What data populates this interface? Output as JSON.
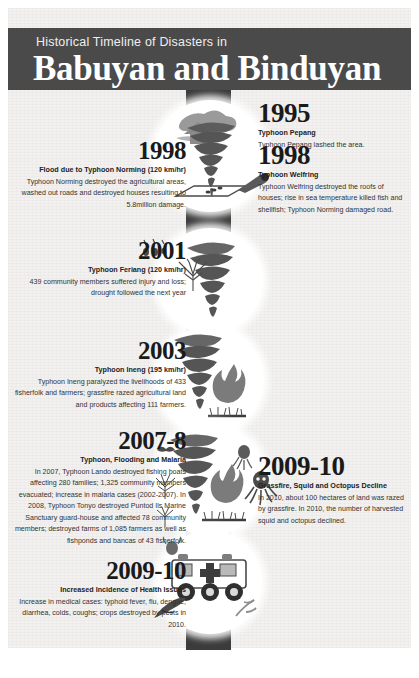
{
  "poster": {
    "background_color": "#f2f1ef",
    "band_color": "#3b3b3b",
    "header_band_color": "#4a4a4a",
    "header": {
      "subtitle": "Historical Timeline of Disasters in",
      "title": "Babuyan and Binduyan"
    }
  },
  "timeline": {
    "entries": [
      {
        "id": "e1995",
        "side": "right",
        "year": "1995",
        "headline": "Typhoon Pepang",
        "body": "Typhoon Pepang lashed the area.",
        "icon": "storm-cloud-icon"
      },
      {
        "id": "e1998-left",
        "side": "left",
        "year": "1998",
        "headline": "Flood due to Typhoon Norming (120 km/hr)",
        "body": "Typhoon Norming destroyed the agricultural areas, washed out roads and destroyed houses resulting to 5.8million damage.",
        "icon": "tornado-icon"
      },
      {
        "id": "e1998-right",
        "side": "right",
        "year": "1998",
        "headline": "Typhoon Welfring",
        "body": "Typhoon Welfring destroyed the roofs of houses; rise in sea temperature killed fish and shellfish; Typhoon Norming damaged road.",
        "icon": "broken-roof-icon"
      },
      {
        "id": "e2001",
        "side": "left",
        "year": "2001",
        "headline": "Typhoon Feriang (120 km/hr)",
        "body": "439 community members suffered injury and loss; drought followed the next year",
        "icon": "drought-tree-icon"
      },
      {
        "id": "e2003",
        "side": "left",
        "year": "2003",
        "headline": "Typhoon Ineng (195 km/hr)",
        "body": "Typhoon Ineng paralyzed the livelihoods of 433 fisherfolk and farmers; grassfire razed agricultural land and products affecting 111 farmers.",
        "icon": "grassfire-icon"
      },
      {
        "id": "e2007-8",
        "side": "left",
        "year": "2007-8",
        "headline": "Typhoon, Flooding and Malaria",
        "body": "In 2007, Typhoon Lando destroyed fishing boats affecting 280 families; 1,325 community members evacuated; increase in malaria cases (2002-2007). In 2008, Typhoon Tonyo destroyed Puntod Ils Marine Sanctuary guard-house and affected 78 community members; destroyed farms of 1,085 farmers as well as fishponds and bancas of 43 fisherfolk.",
        "icon": "tornado-fire-icon"
      },
      {
        "id": "e2009-10-right",
        "side": "right",
        "year": "2009-10",
        "headline": "Grassfire, Squid and Octopus Decline",
        "body": "In 2010, about 100 hectares of land was razed by grassfire. In 2010, the number of harvested squid and octopus declined.",
        "icon": "squid-icon"
      },
      {
        "id": "e2009-10-left",
        "side": "left",
        "year": "2009-10",
        "headline": "Increased Incidence of Health Issues",
        "body": "Increase in medical cases: typhoid fever, flu, dengue, diarrhea, colds, coughs; crops destroyed by pests in 2010.",
        "icon": "ambulance-icon"
      }
    ]
  }
}
